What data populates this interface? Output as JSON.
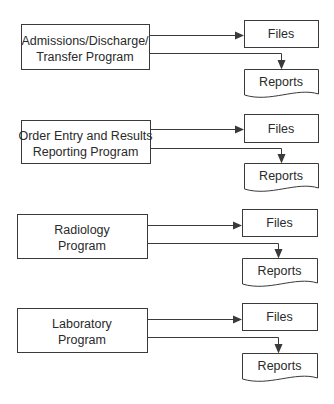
{
  "diagram": {
    "colors": {
      "stroke": "#3a3a3a",
      "text": "#2a2a2a",
      "background": "#ffffff"
    },
    "programs": [
      {
        "name": "admissions-discharge-transfer",
        "lines": [
          "Admissions/Discharge/",
          "Transfer Program"
        ],
        "box": [
          21,
          24,
          128,
          45
        ],
        "files": {
          "label": "Files",
          "box": [
            244,
            20,
            74,
            27
          ],
          "arrow_y": 35
        },
        "reports": {
          "label": "Reports",
          "box": [
            244,
            69,
            74,
            29
          ],
          "line_y": 53,
          "drop_x": 281
        }
      },
      {
        "name": "order-entry-results-reporting",
        "lines": [
          "Order Entry and Results",
          "Reporting Program"
        ],
        "box": [
          21,
          120,
          129,
          43
        ],
        "files": {
          "label": "Files",
          "box": [
            244,
            114,
            74,
            28
          ],
          "arrow_y": 129
        },
        "reports": {
          "label": "Reports",
          "box": [
            244,
            163,
            74,
            29
          ],
          "line_y": 148,
          "drop_x": 281
        }
      },
      {
        "name": "radiology",
        "lines": [
          "Radiology",
          "Program"
        ],
        "box": [
          17,
          214,
          130,
          44
        ],
        "files": {
          "label": "Files",
          "box": [
            242,
            209,
            75,
            27
          ],
          "arrow_y": 225
        },
        "reports": {
          "label": "Reports",
          "box": [
            242,
            258,
            75,
            29
          ],
          "line_y": 243,
          "drop_x": 278
        }
      },
      {
        "name": "laboratory",
        "lines": [
          "Laboratory",
          "Program"
        ],
        "box": [
          17,
          308,
          130,
          44
        ],
        "files": {
          "label": "Files",
          "box": [
            242,
            303,
            75,
            27
          ],
          "arrow_y": 319
        },
        "reports": {
          "label": "Reports",
          "box": [
            242,
            353,
            75,
            29
          ],
          "line_y": 337,
          "drop_x": 278
        }
      }
    ]
  }
}
